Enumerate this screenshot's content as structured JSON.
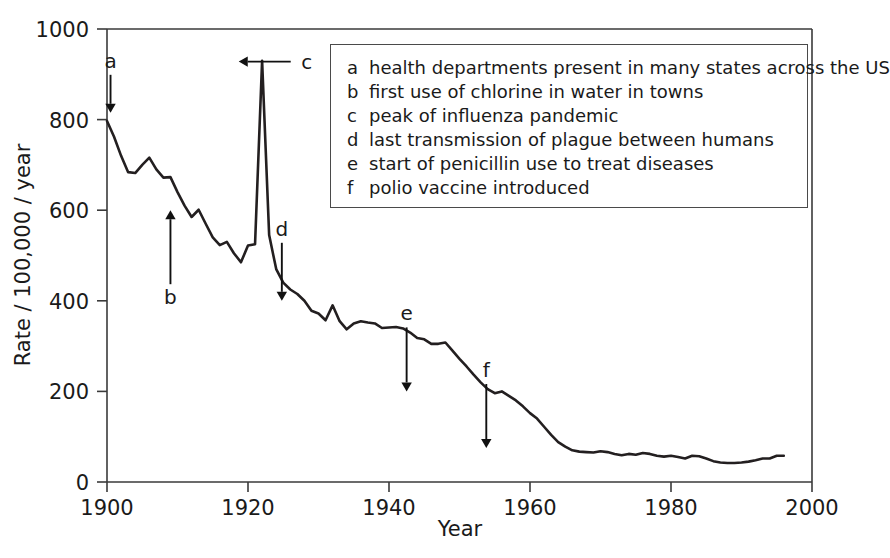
{
  "chart_data": {
    "type": "line",
    "title": "",
    "xlabel": "Year",
    "ylabel": "Rate / 100,000 / year",
    "xlim": [
      1900,
      2000
    ],
    "ylim": [
      0,
      1000
    ],
    "xticks": [
      1900,
      1920,
      1940,
      1960,
      1980,
      2000
    ],
    "yticks": [
      0,
      200,
      400,
      600,
      800,
      1000
    ],
    "grid": false,
    "legend_position": "inside-top-right",
    "series": [
      {
        "name": "Infectious disease mortality rate",
        "x": [
          1900,
          1901,
          1902,
          1903,
          1904,
          1905,
          1906,
          1907,
          1908,
          1909,
          1910,
          1911,
          1912,
          1913,
          1914,
          1915,
          1916,
          1917,
          1918,
          1919,
          1920,
          1921,
          1922,
          1923,
          1924,
          1925,
          1926,
          1927,
          1928,
          1929,
          1930,
          1931,
          1932,
          1933,
          1934,
          1935,
          1936,
          1937,
          1938,
          1939,
          1940,
          1941,
          1942,
          1943,
          1944,
          1945,
          1946,
          1947,
          1948,
          1949,
          1950,
          1951,
          1952,
          1953,
          1954,
          1955,
          1956,
          1957,
          1958,
          1959,
          1960,
          1961,
          1962,
          1963,
          1964,
          1965,
          1966,
          1967,
          1968,
          1969,
          1970,
          1971,
          1972,
          1973,
          1974,
          1975,
          1976,
          1977,
          1978,
          1979,
          1980,
          1981,
          1982,
          1983,
          1984,
          1985,
          1986,
          1987,
          1988,
          1989,
          1990,
          1991,
          1992,
          1993,
          1994,
          1995,
          1996
        ],
        "y": [
          797,
          762,
          720,
          684,
          682,
          700,
          716,
          690,
          672,
          673,
          640,
          610,
          585,
          601,
          570,
          540,
          523,
          530,
          505,
          485,
          522,
          525,
          930,
          545,
          470,
          440,
          425,
          415,
          400,
          378,
          372,
          357,
          390,
          355,
          337,
          350,
          355,
          352,
          350,
          340,
          341,
          342,
          339,
          330,
          318,
          315,
          305,
          305,
          308,
          290,
          272,
          255,
          237,
          220,
          205,
          196,
          200,
          190,
          180,
          167,
          152,
          140,
          122,
          104,
          88,
          78,
          70,
          67,
          66,
          65,
          68,
          66,
          62,
          59,
          62,
          60,
          64,
          62,
          58,
          56,
          58,
          55,
          52,
          58,
          57,
          52,
          46,
          43,
          42,
          42,
          43,
          45,
          48,
          52,
          52,
          58,
          58
        ],
        "note_peak": {
          "year": 1918.4,
          "value": 928,
          "label": "influenza pandemic peak"
        }
      }
    ],
    "markers": [
      {
        "key": "a",
        "year": 1900.5,
        "value": 815,
        "direction": "down"
      },
      {
        "key": "b",
        "year": 1909.0,
        "value": 600,
        "direction": "up"
      },
      {
        "key": "c",
        "year": 1918.4,
        "value": 928,
        "direction": "left"
      },
      {
        "key": "d",
        "year": 1924.8,
        "value": 400,
        "direction": "down"
      },
      {
        "key": "e",
        "year": 1942.5,
        "value": 200,
        "direction": "down"
      },
      {
        "key": "f",
        "year": 1953.8,
        "value": 75,
        "direction": "down"
      }
    ]
  },
  "legend": {
    "items": [
      {
        "key": "a",
        "description": "health departments present in many states across the US"
      },
      {
        "key": "b",
        "description": "first use of chlorine in water in towns"
      },
      {
        "key": "c",
        "description": "peak of influenza pandemic"
      },
      {
        "key": "d",
        "description": "last transmission of plague between humans"
      },
      {
        "key": "e",
        "description": "start of penicillin use to treat diseases"
      },
      {
        "key": "f",
        "description": "polio vaccine introduced"
      }
    ]
  },
  "colors": {
    "line": "#231f20",
    "axis": "#3a3a3a",
    "text": "#1a1a1a",
    "legend_border": "#4a4a4a",
    "background": "#ffffff"
  }
}
